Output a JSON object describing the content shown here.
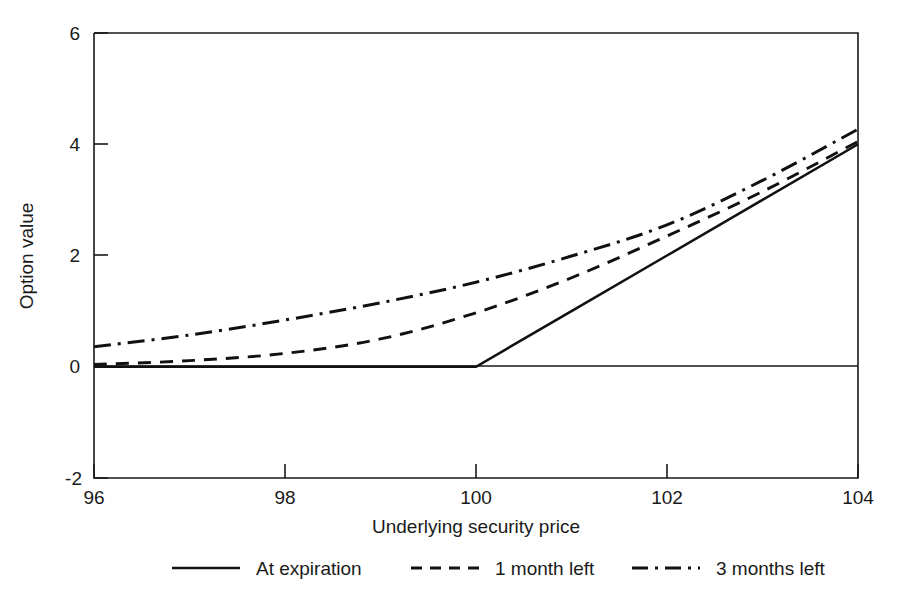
{
  "chart_data": {
    "type": "line",
    "title": "",
    "xlabel": "Underlying security price",
    "ylabel": "Option value",
    "xlim": [
      96,
      104
    ],
    "ylim": [
      -2,
      6
    ],
    "xticks": [
      "96",
      "98",
      "100",
      "102",
      "104"
    ],
    "xtick_values": [
      96,
      98,
      100,
      102,
      104
    ],
    "yticks": [
      "-2",
      "0",
      "2",
      "4",
      "6"
    ],
    "ytick_values": [
      -2,
      0,
      2,
      4,
      6
    ],
    "grid": false,
    "legend_position": "below",
    "zero_line": 0,
    "series": [
      {
        "name": "At expiration",
        "style": "solid",
        "x": [
          96,
          97,
          98,
          99,
          100,
          101,
          102,
          103,
          104
        ],
        "values": [
          0,
          0,
          0,
          0,
          0,
          1,
          2,
          3,
          4
        ]
      },
      {
        "name": "1 month left",
        "style": "dashed",
        "x": [
          96,
          97,
          98,
          99,
          100,
          101,
          102,
          103,
          104
        ],
        "values": [
          0.04,
          0.11,
          0.24,
          0.5,
          0.97,
          1.6,
          2.35,
          3.15,
          4.05
        ]
      },
      {
        "name": "3 months left",
        "style": "dash-dot",
        "x": [
          96,
          97,
          98,
          99,
          100,
          101,
          102,
          103,
          104
        ],
        "values": [
          0.36,
          0.57,
          0.84,
          1.15,
          1.52,
          1.99,
          2.55,
          3.35,
          4.27
        ]
      }
    ]
  },
  "legend": {
    "items": [
      {
        "label": "At expiration",
        "style": "solid"
      },
      {
        "label": "1 month left",
        "style": "dashed"
      },
      {
        "label": "3 months left",
        "style": "dash-dot"
      }
    ]
  },
  "axes": {
    "y_title": "Option value",
    "x_title": "Underlying security price",
    "y_tick_labels": [
      "6",
      "4",
      "2",
      "0",
      "-2"
    ],
    "x_tick_labels": [
      "96",
      "98",
      "100",
      "102",
      "104"
    ]
  }
}
